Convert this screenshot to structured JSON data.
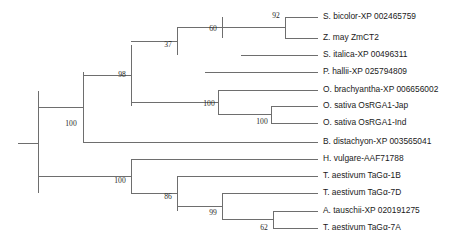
{
  "figure": {
    "type": "phylogenetic-tree",
    "layout": "rectangular-cladogram",
    "orientation": "left-to-right",
    "width": 460,
    "height": 247,
    "background_color": "#ffffff",
    "branch_color": "#6e6e6e",
    "label_color": "#1a1a1a",
    "support_label_color": "#2a2a2a"
  },
  "leaves": [
    {
      "id": "leaf-s-bicolor",
      "label": "S. bicolor-XP 002465759",
      "y": 17,
      "branch_x1": 285,
      "branch_x2": 318
    },
    {
      "id": "leaf-z-may",
      "label": "Z. may ZmCT2",
      "y": 38,
      "branch_x1": 285,
      "branch_x2": 318
    },
    {
      "id": "leaf-s-italica",
      "label": "S. italica-XP 00496311",
      "y": 55,
      "branch_x1": 241,
      "branch_x2": 318
    },
    {
      "id": "leaf-p-hallii",
      "label": "P. hallii-XP 025794809",
      "y": 72,
      "branch_x1": 205,
      "branch_x2": 318
    },
    {
      "id": "leaf-o-brachyantha",
      "label": "O. brachyantha-XP 006656002",
      "y": 90,
      "branch_x1": 218,
      "branch_x2": 318
    },
    {
      "id": "leaf-o-sativa-jap",
      "label": "O. sativa OsRGA1-Jap",
      "y": 106,
      "branch_x1": 271,
      "branch_x2": 318
    },
    {
      "id": "leaf-o-sativa-ind",
      "label": "O. sativa OsRGA1-Ind",
      "y": 123,
      "branch_x1": 271,
      "branch_x2": 318
    },
    {
      "id": "leaf-b-distachyon",
      "label": "B. distachyon-XP 003565041",
      "y": 142,
      "branch_x1": 83,
      "branch_x2": 318
    },
    {
      "id": "leaf-h-vulgare",
      "label": "H. vulgare-AAF71788",
      "y": 159,
      "branch_x1": 131,
      "branch_x2": 318
    },
    {
      "id": "leaf-t-aestivum-1b",
      "label": "T. aestivum TaGα-1B",
      "y": 176,
      "branch_x1": 177,
      "branch_x2": 318
    },
    {
      "id": "leaf-t-aestivum-7d",
      "label": "T. aestivum TaGα-7D",
      "y": 193,
      "branch_x1": 222,
      "branch_x2": 318
    },
    {
      "id": "leaf-a-tauschii",
      "label": "A. tauschii-XP 020191275",
      "y": 211,
      "branch_x1": 273,
      "branch_x2": 318
    },
    {
      "id": "leaf-t-aestivum-7a",
      "label": "T. aestivum TaGα-7A",
      "y": 228,
      "branch_x1": 273,
      "branch_x2": 318
    }
  ],
  "internal_nodes": [
    {
      "id": "node-root",
      "support": "",
      "x": 38,
      "y_top": 91,
      "y_bottom": 193,
      "stem_x1": 18,
      "stem_x2": 38,
      "label_x": 0,
      "label_y": 0
    },
    {
      "id": "node-upper-clade",
      "support": "100",
      "x": 83,
      "y_top": 72,
      "y_bottom": 142,
      "stem_x1": 38,
      "stem_x2": 83,
      "label_x": 71,
      "label_y": 124
    },
    {
      "id": "node-grass-98",
      "support": "98",
      "x": 131,
      "y_top": 45,
      "y_bottom": 106,
      "stem_x1": 83,
      "stem_x2": 131,
      "label_x": 122,
      "label_y": 75
    },
    {
      "id": "node-panicoid-37",
      "support": "37",
      "x": 177,
      "y_top": 28,
      "y_bottom": 55,
      "stem_x1": 131,
      "stem_x2": 177,
      "label_x": 168,
      "label_y": 45
    },
    {
      "id": "node-andropog-60",
      "support": "60",
      "x": 222,
      "y_top": 17,
      "y_bottom": 38,
      "stem_x1": 177,
      "stem_x2": 222,
      "label_x": 213,
      "label_y": 29
    },
    {
      "id": "node-sorghum-92",
      "support": "92",
      "x": 285,
      "y_top": 17,
      "y_bottom": 38,
      "stem_x1": 222,
      "stem_x2": 285,
      "label_x": 276,
      "label_y": 16
    },
    {
      "id": "node-oryza-100",
      "support": "100",
      "x": 218,
      "y_top": 90,
      "y_bottom": 115,
      "stem_x1": 131,
      "stem_x2": 218,
      "label_x": 209,
      "label_y": 104
    },
    {
      "id": "node-sativa-100",
      "support": "100",
      "x": 271,
      "y_top": 106,
      "y_bottom": 123,
      "stem_x1": 218,
      "stem_x2": 271,
      "label_x": 262,
      "label_y": 122
    },
    {
      "id": "node-triticeae-100",
      "support": "100",
      "x": 131,
      "y_top": 159,
      "y_bottom": 193,
      "stem_x1": 38,
      "stem_x2": 131,
      "label_x": 120,
      "label_y": 181
    },
    {
      "id": "node-wheat-86",
      "support": "86",
      "x": 177,
      "y_top": 176,
      "y_bottom": 211,
      "stem_x1": 131,
      "stem_x2": 177,
      "label_x": 168,
      "label_y": 197
    },
    {
      "id": "node-wheat-99",
      "support": "99",
      "x": 222,
      "y_top": 193,
      "y_bottom": 220,
      "stem_x1": 177,
      "stem_x2": 222,
      "label_x": 213,
      "label_y": 213
    },
    {
      "id": "node-wheat-62",
      "support": "62",
      "x": 273,
      "y_top": 211,
      "y_bottom": 228,
      "stem_x1": 222,
      "stem_x2": 273,
      "label_x": 264,
      "label_y": 228
    }
  ]
}
